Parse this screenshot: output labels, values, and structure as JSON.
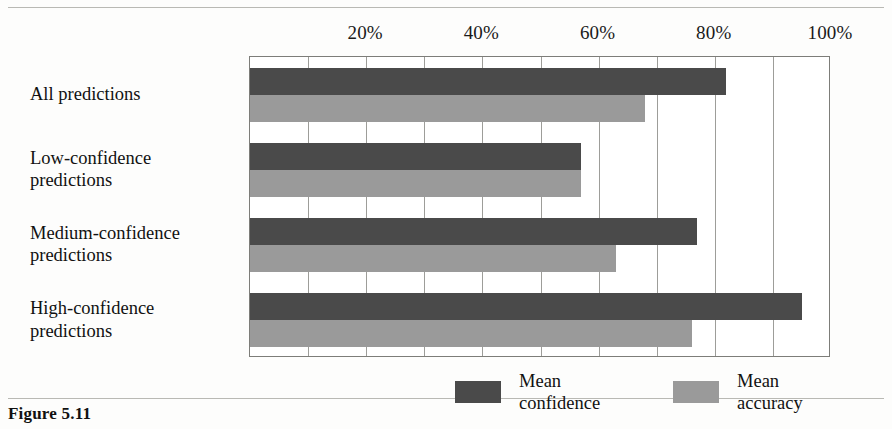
{
  "figure": {
    "caption": "Figure 5.11",
    "axis_unit": "%"
  },
  "legend": {
    "items": [
      {
        "key": "confidence",
        "label": "Mean\nconfidence",
        "color": "#4a4a4a"
      },
      {
        "key": "accuracy",
        "label": "Mean\naccuracy",
        "color": "#9a9a9a"
      }
    ]
  },
  "chart_data": {
    "type": "bar",
    "orientation": "horizontal",
    "title": "",
    "xlabel": "",
    "ylabel": "",
    "xlim": [
      0,
      100
    ],
    "xticks": [
      0,
      10,
      20,
      30,
      40,
      50,
      60,
      70,
      80,
      90,
      100
    ],
    "xtick_labels": [
      "20%",
      "40%",
      "60%",
      "80%",
      "100%"
    ],
    "xtick_label_values": [
      20,
      40,
      60,
      80,
      100
    ],
    "grid": true,
    "legend_position": "bottom",
    "categories": [
      "All predictions",
      "Low-confidence\npredictions",
      "Medium-confidence\npredictions",
      "High-confidence\npredictions"
    ],
    "series": [
      {
        "name": "Mean confidence",
        "color": "#4a4a4a",
        "values": [
          82,
          57,
          77,
          95
        ]
      },
      {
        "name": "Mean accuracy",
        "color": "#9a9a9a",
        "values": [
          68,
          57,
          63,
          76
        ]
      }
    ]
  }
}
